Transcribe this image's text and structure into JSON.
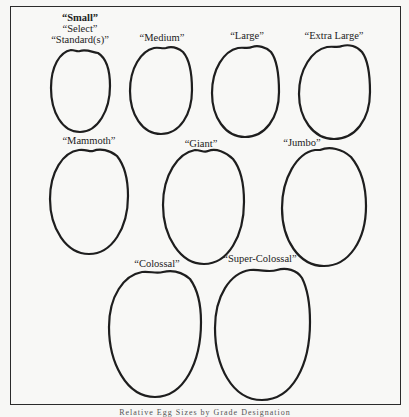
{
  "figure": {
    "caption": "Relative Egg Sizes by Grade Designation"
  },
  "grades": [
    {
      "id": "small",
      "labels": [
        "“Small”",
        "“Select”",
        "“Standard(s)”"
      ]
    },
    {
      "id": "medium",
      "labels": [
        "“Medium”"
      ]
    },
    {
      "id": "large",
      "labels": [
        "“Large”"
      ]
    },
    {
      "id": "extra-large",
      "labels": [
        "“Extra Large”"
      ]
    },
    {
      "id": "mammoth",
      "labels": [
        "“Mammoth”"
      ]
    },
    {
      "id": "giant",
      "labels": [
        "“Giant”"
      ]
    },
    {
      "id": "jumbo",
      "labels": [
        "“Jumbo”"
      ]
    },
    {
      "id": "colossal",
      "labels": [
        "“Colossal”"
      ]
    },
    {
      "id": "super-colossal",
      "labels": [
        "“Super-Colossal”"
      ]
    }
  ],
  "colors": {
    "outline": "#1e1e1e",
    "paper": "#f8f8f6",
    "text": "#222222"
  }
}
